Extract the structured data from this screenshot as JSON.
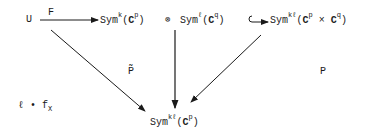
{
  "diagram": {
    "type": "commutative-diagram",
    "nodes": {
      "U": {
        "text": "U"
      },
      "symk": {
        "base": "Sym",
        "sup": "k",
        "open": "(",
        "field": "C",
        "fsup": "p",
        "close": ")"
      },
      "tensor_sep": {
        "text": "⊗"
      },
      "syml": {
        "base": "Sym",
        "sup": "ℓ",
        "open": "(",
        "field": "C",
        "fsup": "q",
        "close": ")"
      },
      "symkl_prod": {
        "base": "Sym",
        "sup": "kℓ",
        "open": "(",
        "field1": "C",
        "f1sup": "p",
        "times": "×",
        "field2": "C",
        "f2sup": "q",
        "close": ")"
      },
      "symkl_bottom": {
        "base": "Sym",
        "sup": "kℓ",
        "open": "(",
        "field": "C",
        "fsup": "p",
        "close": ")"
      }
    },
    "labels": {
      "F": "F",
      "Ptilde": "P̃",
      "P": "P",
      "ell_fx_prefix": "ℓ • f",
      "ell_fx_sub": "X"
    },
    "edges": [
      {
        "from": "U",
        "to": "symk",
        "label": "F",
        "style": "arrow"
      },
      {
        "from": "syml",
        "to": "symkl_prod",
        "style": "hook-arrow"
      },
      {
        "from": "U",
        "to": "symkl_bottom",
        "label": "P̃",
        "style": "arrow"
      },
      {
        "from": "syml",
        "to": "symkl_bottom",
        "style": "arrow"
      },
      {
        "from": "symkl_prod",
        "to": "symkl_bottom",
        "label": "P",
        "style": "arrow"
      }
    ]
  }
}
